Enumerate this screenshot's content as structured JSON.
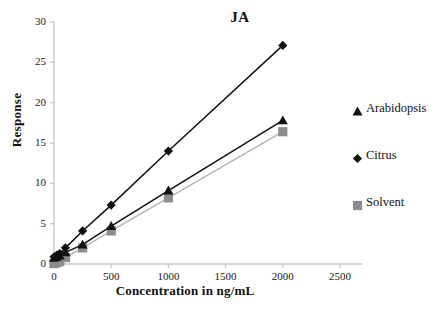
{
  "chart_data": {
    "type": "line",
    "title": "JA",
    "xlabel": "Concentration in ng/mL",
    "ylabel": "Response",
    "xlim": [
      0,
      2500
    ],
    "ylim": [
      0,
      30
    ],
    "xticks": [
      "0",
      "500",
      "1000",
      "1500",
      "2000",
      "2500"
    ],
    "xtick_values": [
      0,
      500,
      1000,
      1500,
      2000,
      2500
    ],
    "yticks": [
      "0",
      "5",
      "10",
      "15",
      "20",
      "25",
      "30"
    ],
    "ytick_values": [
      0,
      5,
      10,
      15,
      20,
      25,
      30
    ],
    "grid": false,
    "legend_position": "right",
    "x": [
      0,
      25,
      50,
      100,
      250,
      500,
      1000,
      2000
    ],
    "series": [
      {
        "name": "Arabidopsis",
        "marker": "triangle",
        "color": "#111111",
        "line_color": "#111111",
        "values": [
          0.75,
          0.9,
          1.05,
          1.45,
          2.4,
          4.7,
          9.1,
          17.8
        ]
      },
      {
        "name": "Citrus",
        "marker": "diamond",
        "color": "#111111",
        "line_color": "#111111",
        "values": [
          0.9,
          1.1,
          1.3,
          2.0,
          4.1,
          7.3,
          14.0,
          27.1
        ]
      },
      {
        "name": "Solvent",
        "marker": "square",
        "color": "#8c8c8c",
        "line_color": "#b5b5b5",
        "values": [
          0.05,
          0.15,
          0.3,
          0.8,
          2.0,
          4.1,
          8.2,
          16.4
        ]
      }
    ],
    "axis_color": "#c9c9c9",
    "background": "#ffffff"
  },
  "legend": {
    "entries": [
      {
        "label": "Arabidopsis",
        "marker": "triangle-marker",
        "color": "#111111"
      },
      {
        "label": "Citrus",
        "marker": "diamond-marker",
        "color": "#111111"
      },
      {
        "label": "Solvent",
        "marker": "square-marker",
        "color": "#8c8c8c"
      }
    ]
  },
  "caption": {
    "text": ""
  }
}
